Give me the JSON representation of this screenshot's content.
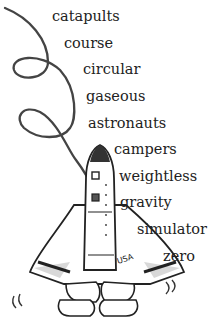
{
  "words": [
    {
      "text": "catapults",
      "x": 52,
      "y": 9
    },
    {
      "text": "course",
      "x": 64,
      "y": 36
    },
    {
      "text": "circular",
      "x": 83,
      "y": 62
    },
    {
      "text": "gaseous",
      "x": 86,
      "y": 89
    },
    {
      "text": "astronauts",
      "x": 88,
      "y": 116
    },
    {
      "text": "campers",
      "x": 114,
      "y": 142
    },
    {
      "text": "weightless",
      "x": 119,
      "y": 169
    },
    {
      "text": "gravity",
      "x": 120,
      "y": 195
    },
    {
      "text": "simulator",
      "x": 137,
      "y": 222
    },
    {
      "text": "zero",
      "x": 163,
      "y": 249
    }
  ],
  "illustration": {
    "subject": "space shuttle with looping flight trail",
    "shuttle_label": "USA"
  },
  "colors": {
    "ink": "#333333",
    "shade": "#d8d8d8"
  }
}
